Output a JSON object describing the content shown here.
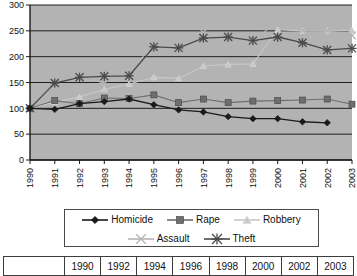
{
  "chart_data": {
    "type": "line",
    "title": "",
    "subtitle": "",
    "xlabel": "",
    "ylabel": "",
    "grid": true,
    "legend_position": "bottom",
    "xlim": [
      1990,
      2003
    ],
    "ylim": [
      0,
      300
    ],
    "yticks": [
      0,
      50,
      100,
      150,
      200,
      250,
      300
    ],
    "categories": [
      "1990",
      "1991",
      "1992",
      "1993",
      "1994",
      "1995",
      "1996",
      "1997",
      "1998",
      "1999",
      "2000",
      "2001",
      "2002",
      "2003"
    ],
    "series": [
      {
        "name": "Homicide",
        "marker": "diamond",
        "color": "#1a1a1a",
        "values": [
          100,
          98,
          109,
          113,
          118,
          107,
          97,
          93,
          84,
          80,
          80,
          74,
          72,
          null
        ]
      },
      {
        "name": "Rape",
        "marker": "square",
        "color": "#6e6e6e",
        "values": [
          100,
          115,
          109,
          120,
          119,
          126,
          111,
          118,
          111,
          114,
          115,
          116,
          118,
          108
        ]
      },
      {
        "name": "Robbery",
        "marker": "triangle",
        "color": "#c9c9c9",
        "values": [
          100,
          112,
          122,
          137,
          147,
          160,
          158,
          182,
          185,
          186,
          252,
          250,
          250,
          251
        ]
      },
      {
        "name": "Assault",
        "marker": "x",
        "color": "#b5b5b5",
        "values": [
          100,
          119,
          136,
          152,
          160,
          232,
          234,
          247,
          239,
          232,
          267,
          251,
          250,
          241
        ]
      },
      {
        "name": "Theft",
        "marker": "star",
        "color": "#4a4a4a",
        "values": [
          100,
          149,
          160,
          162,
          163,
          219,
          217,
          236,
          238,
          231,
          238,
          227,
          213,
          216
        ]
      }
    ]
  },
  "axes": {
    "y_tick_labels": [
      "300",
      "250",
      "200",
      "150",
      "100",
      "50",
      "0"
    ],
    "x_tick_labels": [
      "1990",
      "1991",
      "1992",
      "1993",
      "1994",
      "1995",
      "1996",
      "1997",
      "1998",
      "1999",
      "2000",
      "2001",
      "2002",
      "2003"
    ]
  },
  "legend": {
    "row1": [
      {
        "label": "Homicide",
        "marker": "diamond",
        "color": "#1a1a1a"
      },
      {
        "label": "Rape",
        "marker": "square",
        "color": "#6e6e6e"
      },
      {
        "label": "Robbery",
        "marker": "triangle",
        "color": "#c9c9c9"
      }
    ],
    "row2": [
      {
        "label": "Assault",
        "marker": "x",
        "color": "#b5b5b5"
      },
      {
        "label": "Theft",
        "marker": "star",
        "color": "#4a4a4a"
      }
    ]
  },
  "year_table": {
    "cells": [
      "",
      "1990",
      "1992",
      "1994",
      "1996",
      "1998",
      "2000",
      "2002",
      "2003"
    ]
  },
  "colors": {
    "plot_background": "#b3b3b3",
    "gridline": "#1f1f1f",
    "axis": "#1a1a1a",
    "text": "#111111"
  }
}
